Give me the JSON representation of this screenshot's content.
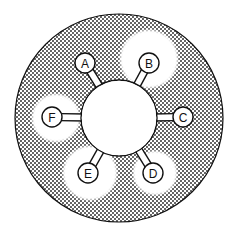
{
  "diagram": {
    "type": "hub-and-spoke",
    "colors": {
      "background": "#ffffff",
      "stroke": "#111111",
      "dot": "#222222",
      "fill_clear": "#ffffff"
    },
    "outer_circle": {
      "cx": 119,
      "cy": 118,
      "r": 104
    },
    "hub": {
      "cx": 119,
      "cy": 118,
      "r": 38
    },
    "nodes": [
      {
        "id": "A",
        "label": "A",
        "cx": 85,
        "cy": 63,
        "r": 10,
        "halo": null
      },
      {
        "id": "B",
        "label": "B",
        "cx": 149,
        "cy": 63,
        "r": 10,
        "halo": {
          "cx": 149,
          "cy": 59,
          "r": 29
        }
      },
      {
        "id": "C",
        "label": "C",
        "cx": 183,
        "cy": 117,
        "r": 10,
        "halo": null
      },
      {
        "id": "D",
        "label": "D",
        "cx": 153,
        "cy": 173,
        "r": 10,
        "halo": {
          "cx": 155,
          "cy": 173,
          "r": 22
        }
      },
      {
        "id": "E",
        "label": "E",
        "cx": 88,
        "cy": 173,
        "r": 10,
        "halo": {
          "cx": 90,
          "cy": 173,
          "r": 27
        }
      },
      {
        "id": "F",
        "label": "F",
        "cx": 52,
        "cy": 117,
        "r": 10,
        "halo": {
          "cx": 56,
          "cy": 118,
          "r": 24
        }
      }
    ]
  }
}
